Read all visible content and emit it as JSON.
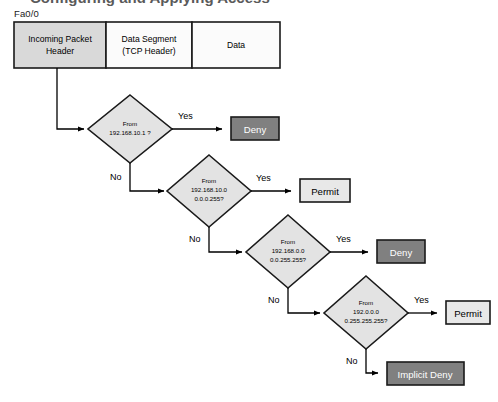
{
  "page": {
    "cropped_heading": "Configuring and Applying Access",
    "interface_label": "Fa0/0"
  },
  "packet": {
    "segments": [
      {
        "id": "incoming-packet-header",
        "line1": "Incoming Packet",
        "line2": "Header",
        "fill": "#d9d9d9"
      },
      {
        "id": "data-segment-tcp-header",
        "line1": "Data Segment",
        "line2": "(TCP Header)",
        "fill": "#fbfbfb"
      },
      {
        "id": "data",
        "line1": "Data",
        "line2": "",
        "fill": "#fbfbfb"
      }
    ]
  },
  "flow": {
    "yes_label": "Yes",
    "no_label": "No",
    "decisions": [
      {
        "id": "decision-192-168-10-1",
        "line1": "From",
        "line2": "192.168.10.1 ?",
        "line3": "",
        "yes_target": "Deny"
      },
      {
        "id": "decision-192-168-10-0",
        "line1": "From",
        "line2": "192.168.10.0",
        "line3": "0.0.0.255?",
        "yes_target": "Permit"
      },
      {
        "id": "decision-192-168-0-0",
        "line1": "From",
        "line2": "192.168.0.0",
        "line3": "0.0.255.255?",
        "yes_target": "Deny"
      },
      {
        "id": "decision-192-0-0-0",
        "line1": "From",
        "line2": "192.0.0.0",
        "line3": "0.255.255.255?",
        "yes_target": "Permit"
      }
    ],
    "terminals": [
      {
        "id": "terminal-deny-1",
        "label": "Deny",
        "style": "dark"
      },
      {
        "id": "terminal-permit-1",
        "label": "Permit",
        "style": "light"
      },
      {
        "id": "terminal-deny-2",
        "label": "Deny",
        "style": "dark"
      },
      {
        "id": "terminal-permit-2",
        "label": "Permit",
        "style": "light"
      },
      {
        "id": "terminal-implicit-deny",
        "label": "Implicit Deny",
        "style": "dark"
      }
    ]
  },
  "colors": {
    "diamond_fill": "#e3e3e3",
    "diamond_stroke": "#1a1a1a",
    "deny_fill": "#808080",
    "permit_fill": "#e8e8e8",
    "line": "#000000",
    "box_stroke": "#1a1a1a"
  }
}
